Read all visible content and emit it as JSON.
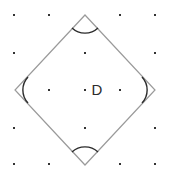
{
  "figure": {
    "label": "D",
    "label_position": {
      "x": 97,
      "y": 90
    },
    "canvas": {
      "width": 170,
      "height": 179,
      "background": "#ffffff"
    },
    "colors": {
      "dot": "#333333",
      "shape_stroke": "#9a9a9a",
      "arc_stroke": "#2b2b2b",
      "label": "#2b2b2b"
    },
    "shape": {
      "name": "square",
      "orientation": "rotated-45-diamond",
      "stroke_width": 1.2,
      "vertices": [
        {
          "name": "top",
          "x": 85,
          "y": 15
        },
        {
          "name": "right",
          "x": 155,
          "y": 90
        },
        {
          "name": "bottom",
          "x": 85,
          "y": 165
        },
        {
          "name": "left",
          "x": 15,
          "y": 90
        }
      ]
    },
    "angle_marks": [
      {
        "at": "top",
        "path": "M 72 28 A 19 19 0 0 0 98 28",
        "stroke_width": 1.4
      },
      {
        "at": "right",
        "path": "M 142 77 A 19 19 0 0 1 142 103",
        "stroke_width": 1.4
      },
      {
        "at": "bottom",
        "path": "M 72 152 A 19 19 0 0 1 98 152",
        "stroke_width": 1.4
      },
      {
        "at": "left",
        "path": "M 28 77 A 19 19 0 0 0 28 103",
        "stroke_width": 1.4
      }
    ],
    "grid": {
      "rows": 5,
      "cols": 5,
      "spacing_x": 35,
      "spacing_y": 37,
      "dot_size": 2,
      "dots": [
        {
          "x": 14,
          "y": 15
        },
        {
          "x": 49,
          "y": 15
        },
        {
          "x": 120,
          "y": 15
        },
        {
          "x": 155,
          "y": 15
        },
        {
          "x": 14,
          "y": 53
        },
        {
          "x": 85,
          "y": 53
        },
        {
          "x": 155,
          "y": 53
        },
        {
          "x": 49,
          "y": 90
        },
        {
          "x": 85,
          "y": 90
        },
        {
          "x": 120,
          "y": 90
        },
        {
          "x": 14,
          "y": 128
        },
        {
          "x": 85,
          "y": 128
        },
        {
          "x": 155,
          "y": 128
        },
        {
          "x": 14,
          "y": 164
        },
        {
          "x": 49,
          "y": 164
        },
        {
          "x": 120,
          "y": 164
        },
        {
          "x": 155,
          "y": 164
        }
      ]
    }
  }
}
